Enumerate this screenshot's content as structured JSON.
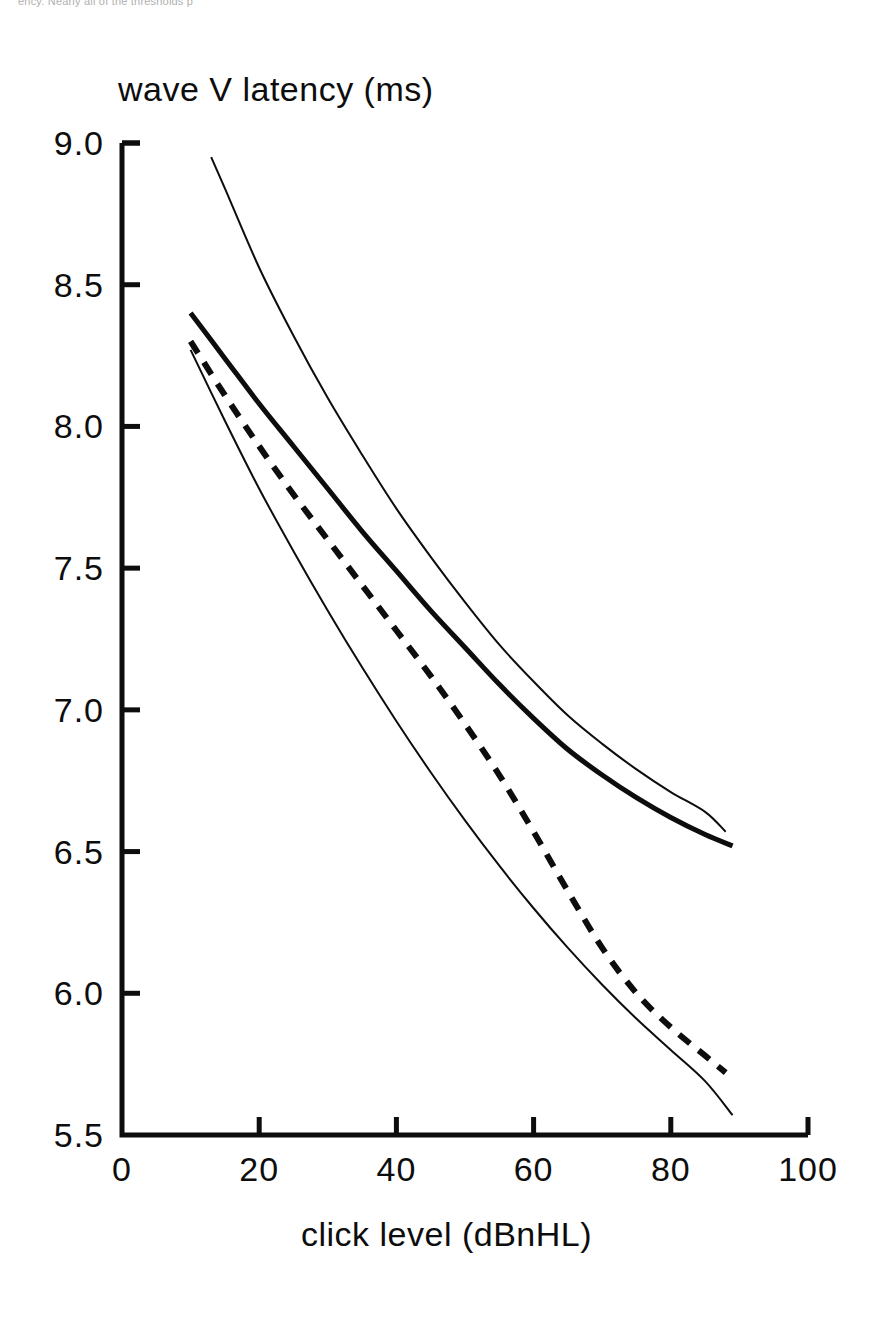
{
  "scan": {
    "header_fragment": "ency. Nearly all of the thresholds p"
  },
  "chart_data": {
    "type": "line",
    "title": "",
    "xlabel": "click level (dBnHL)",
    "ylabel": "wave V latency (ms)",
    "xlim": [
      0,
      100
    ],
    "ylim": [
      5.5,
      9.0
    ],
    "xticks": [
      0,
      20,
      40,
      60,
      80,
      100
    ],
    "xtick_labels": [
      "0",
      "20",
      "40",
      "60",
      "80",
      "100"
    ],
    "yticks": [
      5.5,
      6.0,
      6.5,
      7.0,
      7.5,
      8.0,
      8.5,
      9.0
    ],
    "ytick_labels": [
      "5.5",
      "6.0",
      "6.5",
      "7.0",
      "7.5",
      "8.0",
      "8.5",
      "9.0"
    ],
    "grid": false,
    "legend": null,
    "axis_style": "open-box-left-bottom",
    "series": [
      {
        "name": "upper-thin-curve",
        "style": "solid",
        "linewidth": 2,
        "x": [
          13,
          15,
          20,
          25,
          30,
          35,
          40,
          45,
          50,
          55,
          60,
          65,
          70,
          75,
          80,
          85,
          88
        ],
        "y": [
          8.95,
          8.84,
          8.56,
          8.32,
          8.1,
          7.9,
          7.71,
          7.54,
          7.38,
          7.23,
          7.1,
          6.98,
          6.88,
          6.79,
          6.71,
          6.64,
          6.57
        ]
      },
      {
        "name": "thick-solid-curve",
        "style": "solid",
        "linewidth": 5,
        "x": [
          10,
          15,
          20,
          25,
          30,
          35,
          40,
          45,
          50,
          55,
          60,
          65,
          70,
          75,
          80,
          85,
          89
        ],
        "y": [
          8.4,
          8.24,
          8.08,
          7.93,
          7.78,
          7.63,
          7.49,
          7.35,
          7.22,
          7.09,
          6.97,
          6.86,
          6.77,
          6.69,
          6.62,
          6.56,
          6.52
        ]
      },
      {
        "name": "dashed-curve",
        "style": "dashed",
        "linewidth": 6,
        "x": [
          10,
          15,
          20,
          25,
          30,
          35,
          40,
          45,
          50,
          55,
          60,
          65,
          70,
          75,
          80,
          85,
          88
        ],
        "y": [
          8.3,
          8.11,
          7.93,
          7.76,
          7.6,
          7.44,
          7.28,
          7.12,
          6.95,
          6.77,
          6.57,
          6.36,
          6.16,
          6.0,
          5.88,
          5.78,
          5.72
        ]
      },
      {
        "name": "lower-thin-curve",
        "style": "solid",
        "linewidth": 2,
        "x": [
          10,
          15,
          20,
          25,
          30,
          35,
          40,
          45,
          50,
          55,
          60,
          65,
          70,
          75,
          80,
          85,
          89
        ],
        "y": [
          8.27,
          8.02,
          7.78,
          7.56,
          7.35,
          7.15,
          6.96,
          6.78,
          6.61,
          6.45,
          6.3,
          6.16,
          6.03,
          5.91,
          5.8,
          5.69,
          5.57
        ]
      }
    ]
  },
  "geometry": {
    "plot_left_px": 122,
    "plot_right_px": 808,
    "plot_top_px": 143,
    "plot_bottom_px": 1135
  }
}
